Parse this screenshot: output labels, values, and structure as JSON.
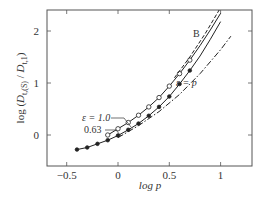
{
  "chart_data": {
    "type": "line",
    "title": "",
    "xlabel": "log p",
    "ylabel": "log (D_t,(S) / D_t,1)",
    "xlim": [
      -0.69,
      1.3
    ],
    "ylim": [
      -0.6,
      2.4
    ],
    "xticks": [
      -0.5,
      0,
      0.5,
      1
    ],
    "yticks": [
      0,
      1,
      2
    ],
    "xtick_labels": [
      "−0.5",
      "0",
      "0.5",
      "1"
    ],
    "ytick_labels": [
      "0",
      "1",
      "2"
    ],
    "grid": false,
    "legend": null,
    "series": [
      {
        "name": "ε = 1.0",
        "style": "solid, open circles",
        "x": [
          -0.1,
          0.0,
          0.1,
          0.2,
          0.3,
          0.4,
          0.5,
          0.6,
          0.7,
          0.8,
          0.9,
          1.0
        ],
        "y": [
          0.0,
          0.12,
          0.24,
          0.38,
          0.54,
          0.72,
          0.94,
          1.18,
          1.44,
          1.72,
          2.02,
          2.34
        ]
      },
      {
        "name": "0.63",
        "style": "solid, filled circles",
        "x": [
          -0.4,
          -0.3,
          -0.2,
          -0.1,
          0.0,
          0.1,
          0.2,
          0.3,
          0.4,
          0.5,
          0.6,
          0.7,
          0.8,
          0.9,
          1.0
        ],
        "y": [
          -0.28,
          -0.24,
          -0.17,
          -0.1,
          -0.01,
          0.1,
          0.22,
          0.37,
          0.54,
          0.74,
          0.98,
          1.24,
          1.52,
          1.84,
          2.18
        ]
      },
      {
        "name": "B",
        "style": "dashed",
        "x": [
          0.55,
          0.7,
          0.85,
          1.0
        ],
        "y": [
          1.1,
          1.5,
          1.95,
          2.45
        ]
      },
      {
        "name": "ε = p",
        "style": "dash-dot",
        "x": [
          0.0,
          0.2,
          0.4,
          0.6,
          0.8,
          1.0,
          1.1
        ],
        "y": [
          -0.05,
          0.18,
          0.45,
          0.78,
          1.18,
          1.64,
          1.9
        ]
      }
    ],
    "annotations": [
      {
        "text": "ε = 1.0",
        "x": -0.22,
        "y": 0.38
      },
      {
        "text": "0.63",
        "x": -0.22,
        "y": 0.28
      },
      {
        "text": "B",
        "x": 0.6,
        "y": 2.0
      },
      {
        "text": "ε = p",
        "x": 0.55,
        "y": 1.0
      }
    ]
  },
  "labels": {
    "x_axis": "log p",
    "y_axis_prefix": "log (",
    "y_axis_num": "D",
    "y_axis_num_sub": "t,(S)",
    "y_axis_den": "D",
    "y_axis_den_sub": "t,1",
    "y_axis_suffix": ")",
    "ann_eps1": "ε = 1.0",
    "ann_063": "0.63",
    "ann_B": "B",
    "ann_eps_p": "ε = p"
  }
}
